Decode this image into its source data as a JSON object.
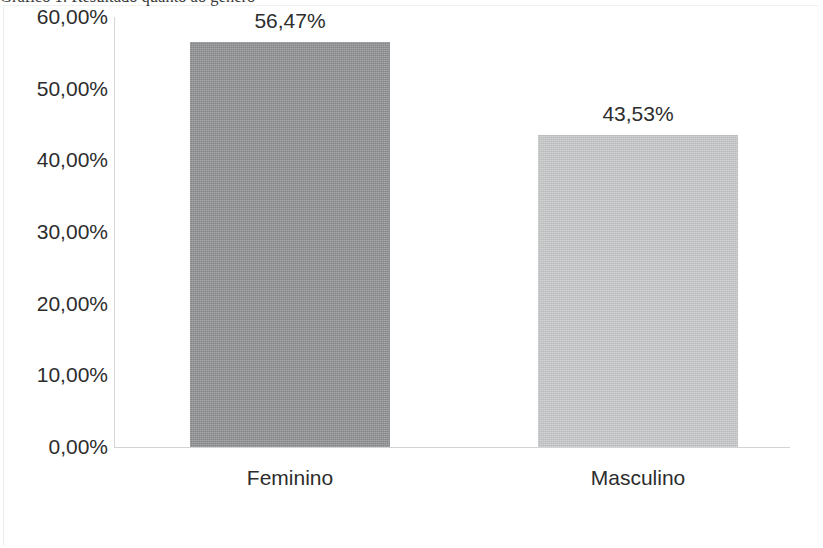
{
  "caption": "Gráfico 1: Resultado quanto ao gênero",
  "chart_data": {
    "type": "bar",
    "title": "",
    "xlabel": "",
    "ylabel": "",
    "categories": [
      "Feminino",
      "Masculino"
    ],
    "values": [
      56.47,
      43.53
    ],
    "data_labels": [
      "56,47%",
      "43,53%"
    ],
    "bar_colors": [
      "#8f9092",
      "#c7c8c9"
    ],
    "ylim": [
      0,
      60
    ],
    "y_ticks": [
      60,
      50,
      40,
      30,
      20,
      10,
      0
    ],
    "y_tick_labels": [
      "60,00%",
      "50,00%",
      "40,00%",
      "30,00%",
      "20,00%",
      "10,00%",
      "0,00%"
    ],
    "grid": false,
    "legend": false,
    "legend_position": "none",
    "axis_line_color": "#d4d5d6"
  }
}
